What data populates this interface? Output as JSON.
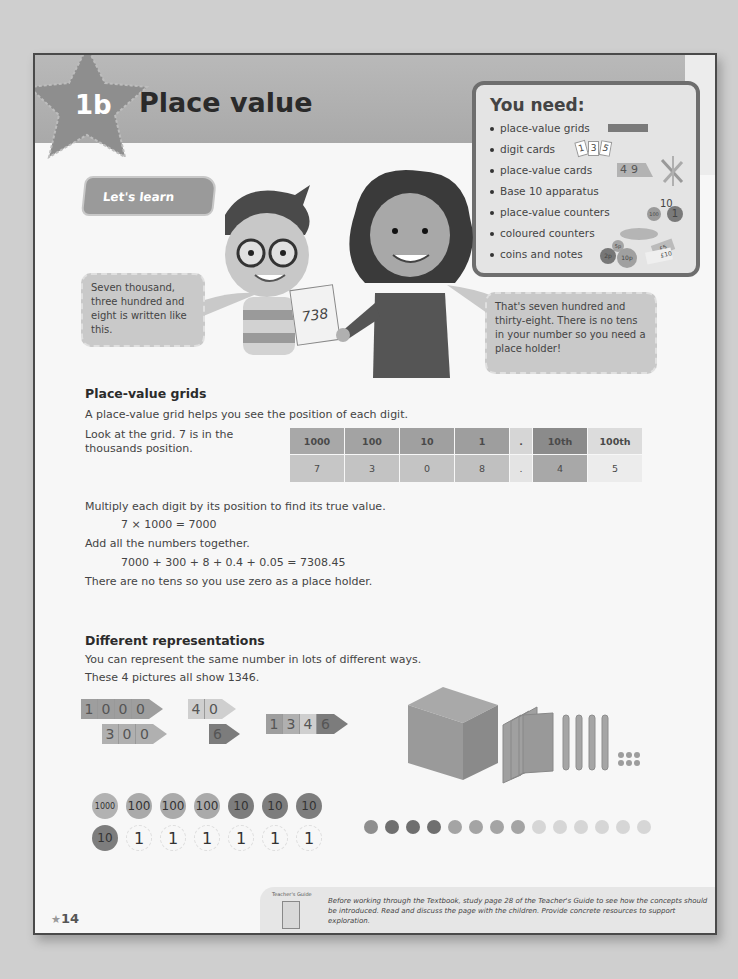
{
  "header": {
    "lesson_number": "1b",
    "title": "Place value"
  },
  "you_need": {
    "title": "You need:",
    "items": [
      {
        "label": "place-value grids",
        "icon": "grid-strip-icon"
      },
      {
        "label": "digit cards",
        "icon": "digit-cards-icon",
        "cards": [
          "1",
          "3",
          "5"
        ]
      },
      {
        "label": "place-value cards",
        "icon": "place-value-cards-icon",
        "cards": [
          "4",
          "9"
        ]
      },
      {
        "label": "Base 10 apparatus",
        "icon": "base10-icon"
      },
      {
        "label": "place-value counters",
        "icon": "pv-counters-icon",
        "counters": [
          "100",
          "10",
          "1"
        ]
      },
      {
        "label": "coloured counters",
        "icon": "coloured-counters-icon"
      },
      {
        "label": "coins and notes",
        "icon": "coins-notes-icon",
        "coins": [
          "2p",
          "5p",
          "10p",
          "£5",
          "£10"
        ]
      }
    ]
  },
  "lets_learn": {
    "label": "Let's learn",
    "boy_speech": "Seven thousand, three hundred and eight is written like this.",
    "card_number": "738",
    "girl_speech": "That's seven hundred and thirty-eight. There is no tens in your number so you need a place holder!"
  },
  "place_value_grids": {
    "heading": "Place-value grids",
    "intro": "A place-value grid helps you see the position of each digit.",
    "look_line1": "Look at the grid. 7 is in the",
    "look_line2": "thousands position.",
    "grid": {
      "headers": [
        "1000",
        "100",
        "10",
        "1",
        ".",
        "10th",
        "100th"
      ],
      "values": [
        "7",
        "3",
        "0",
        "8",
        ".",
        "4",
        "5"
      ],
      "header_colors": [
        "#a8a8a8",
        "#a3a3a3",
        "#a0a0a0",
        "#9e9e9e",
        "#d6d6d6",
        "#8b8b8b",
        "#dcdcdc"
      ],
      "value_colors": [
        "#c6c6c6",
        "#c3c3c3",
        "#c4c4c4",
        "#c0c0c0",
        "#e4e4e4",
        "#a8a8a8",
        "#ececec"
      ]
    },
    "multiply_text": "Multiply each digit by its position to find its true value.",
    "multiply_eq": "7 × 1000 = 7000",
    "add_text": "Add all the numbers together.",
    "add_eq": "7000 + 300 + 8 + 0.4 + 0.05 = 7308.45",
    "conclusion": "There are no tens so you use zero as a place holder."
  },
  "representations": {
    "heading": "Different representations",
    "intro": "You can represent the same number in lots of different ways.",
    "subintro": "These 4 pictures all show 1346.",
    "arrow_cards": [
      {
        "digits": [
          "1",
          "0",
          "0",
          "0"
        ],
        "color": "#9e9e9e"
      },
      {
        "digits": [
          "3",
          "0",
          "0"
        ],
        "color": "#b0b0b0"
      },
      {
        "digits": [
          "4",
          "0"
        ],
        "color": "#cfcfcf"
      },
      {
        "digits": [
          "6"
        ],
        "color": "#7c7c7c"
      }
    ],
    "combined_card": {
      "digits": [
        "1",
        "3",
        "4",
        "6"
      ],
      "colors": [
        "#9e9e9e",
        "#b0b0b0",
        "#cfcfcf",
        "#7c7c7c"
      ]
    },
    "pv_counters_row1": [
      "1000",
      "100",
      "100",
      "100",
      "10",
      "10",
      "10"
    ],
    "pv_counters_row2": [
      "10",
      "1",
      "1",
      "1",
      "1",
      "1",
      "1"
    ],
    "dots": {
      "thousands": 1,
      "hundreds": 3,
      "tens": 4,
      "ones": 6
    }
  },
  "footer": {
    "page_number": "14",
    "tg_label": "Teacher's Guide",
    "tg_text": "Before working through the Textbook, study page 28 of the Teacher's Guide to see how the concepts should be introduced. Read and discuss the page with the children. Provide concrete resources to support exploration."
  }
}
